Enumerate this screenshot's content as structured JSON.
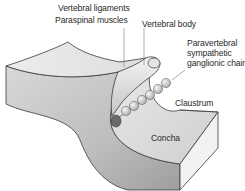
{
  "diagram": {
    "title": "",
    "labels": {
      "vertebral_ligaments": "Vertebral ligaments",
      "paraspinal_muscles": "Paraspinal muscles",
      "vertebral_body": "Vertebral body",
      "paravertebral_chain": "Paravertebral\nsympathetic\nganglionic chain",
      "claustrum": "Claustrum",
      "concha": "Concha"
    },
    "colors": {
      "background": "#ffffff",
      "surface_top": "#e6e6e6",
      "surface_front": "#c9c9c9",
      "surface_dark": "#a8a8a8",
      "concha_floor": "#dcdcdc",
      "block_side": "#f2f2f2",
      "outline": "#3a3a3a",
      "leader": "#8a8a8a",
      "ganglion": "#d4d4d4",
      "ganglion_end": "#6a6a6a",
      "text": "#2a2a2a"
    }
  }
}
